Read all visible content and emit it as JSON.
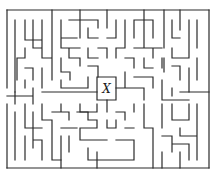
{
  "diagram": {
    "type": "maze",
    "center_label": "X",
    "colors": {
      "background": "#ffffff",
      "wall": "#2a2a2a",
      "label": "#1a1a1a"
    },
    "bounds": {
      "left": 7,
      "top": 10,
      "right": 209,
      "bottom": 168
    },
    "center_box": {
      "left": 97,
      "top": 77,
      "right": 116,
      "bottom": 100
    }
  }
}
